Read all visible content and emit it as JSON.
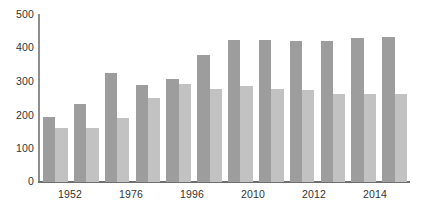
{
  "chart_data": {
    "type": "bar",
    "title": "",
    "subtitle": "",
    "xlabel": "",
    "ylabel": "",
    "ylim": [
      0,
      500
    ],
    "yticks": [
      0,
      100,
      200,
      300,
      400,
      500
    ],
    "ytick_labels": [
      "0",
      "100",
      "200",
      "300",
      "400",
      "500"
    ],
    "grid": false,
    "legend": "none",
    "categories": [
      "1952",
      "",
      "1976",
      "",
      "1996",
      "",
      "2010",
      "",
      "2012",
      "",
      "2014",
      ""
    ],
    "visible_xtick_labels": [
      "1952",
      "1976",
      "1996",
      "2010",
      "2012",
      "2014"
    ],
    "series": [
      {
        "name": "series-dark",
        "color": "#9d9d9d",
        "values": [
          193,
          232,
          323,
          288,
          307,
          378,
          424,
          423,
          421,
          420,
          430,
          433
        ]
      },
      {
        "name": "series-light",
        "color": "#c2c2c2",
        "values": [
          160,
          160,
          190,
          250,
          293,
          278,
          286,
          278,
          273,
          263,
          262,
          262
        ]
      }
    ],
    "axis_color": "#8e8e8e",
    "baseline_color": "#6f6f6f",
    "background": "#ffffff"
  }
}
